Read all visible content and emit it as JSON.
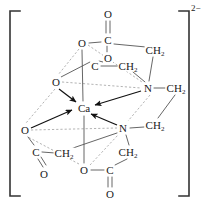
{
  "figure": {
    "charge": "2−",
    "ion_center": "Ca",
    "colors": {
      "bond": "#4d4d4d",
      "dashed": "#8c8c8c",
      "arrow": "#111111",
      "bracket": "#333333",
      "text": "#1a1a1a",
      "background": "#ffffff"
    }
  },
  "brackets": {
    "left": "[",
    "right": "]"
  },
  "atoms": [
    {
      "id": "o-top-double",
      "label": "O",
      "sub": "",
      "x": 108,
      "y": 14
    },
    {
      "id": "c-top",
      "label": "C",
      "sub": "",
      "x": 108,
      "y": 40
    },
    {
      "id": "o-top-left",
      "label": "O",
      "sub": "",
      "x": 82,
      "y": 43
    },
    {
      "id": "ch2-top-right",
      "label": "CH",
      "sub": "2",
      "x": 155,
      "y": 50
    },
    {
      "id": "o-upper-mid",
      "label": "O",
      "sub": "",
      "x": 108,
      "y": 58
    },
    {
      "id": "c-upper-left",
      "label": "C",
      "sub": "",
      "x": 95,
      "y": 66
    },
    {
      "id": "ch2-upper-mid",
      "label": "CH",
      "sub": "2",
      "x": 128,
      "y": 66
    },
    {
      "id": "o-upper-left",
      "label": "O",
      "sub": "",
      "x": 56,
      "y": 82
    },
    {
      "id": "n-upper",
      "label": "N",
      "sub": "",
      "x": 148,
      "y": 88
    },
    {
      "id": "ch2-right-top",
      "label": "CH",
      "sub": "2",
      "x": 176,
      "y": 88
    },
    {
      "id": "ca-center",
      "label": "Ca",
      "sub": "",
      "x": 84,
      "y": 108
    },
    {
      "id": "o-lower-left",
      "label": "O",
      "sub": "",
      "x": 25,
      "y": 130
    },
    {
      "id": "n-lower",
      "label": "N",
      "sub": "",
      "x": 123,
      "y": 128
    },
    {
      "id": "ch2-right-bot",
      "label": "CH",
      "sub": "2",
      "x": 155,
      "y": 125
    },
    {
      "id": "c-lower-left",
      "label": "C",
      "sub": "",
      "x": 36,
      "y": 152
    },
    {
      "id": "ch2-lower-left",
      "label": "CH",
      "sub": "2",
      "x": 64,
      "y": 153
    },
    {
      "id": "ch2-bottom-mid",
      "label": "CH",
      "sub": "2",
      "x": 128,
      "y": 152
    },
    {
      "id": "o-bottom-left",
      "label": "O",
      "sub": "",
      "x": 44,
      "y": 174
    },
    {
      "id": "o-bottom-mid",
      "label": "O",
      "sub": "",
      "x": 84,
      "y": 170
    },
    {
      "id": "c-bottom",
      "label": "C",
      "sub": "",
      "x": 110,
      "y": 170
    },
    {
      "id": "o-bottom",
      "label": "O",
      "sub": "",
      "x": 110,
      "y": 194
    }
  ],
  "bonds": [
    {
      "from": "o-top-double",
      "to": "c-top",
      "type": "double-vertical"
    },
    {
      "from": "c-top",
      "to": "o-top-left",
      "type": "single"
    },
    {
      "from": "c-top",
      "to": "ch2-top-right",
      "type": "single"
    },
    {
      "from": "c-top",
      "to": "o-upper-mid",
      "type": "single"
    },
    {
      "from": "o-upper-mid",
      "to": "c-upper-left",
      "type": "single"
    },
    {
      "from": "c-upper-left",
      "to": "ch2-upper-mid",
      "type": "single"
    },
    {
      "from": "ch2-upper-mid",
      "to": "n-upper",
      "type": "single"
    },
    {
      "from": "ch2-top-right",
      "to": "n-upper",
      "type": "single"
    },
    {
      "from": "n-upper",
      "to": "ch2-right-top",
      "type": "single"
    },
    {
      "from": "ch2-right-top",
      "to": "ch2-right-bot",
      "type": "single"
    },
    {
      "from": "ch2-right-bot",
      "to": "n-lower",
      "type": "single"
    },
    {
      "from": "n-lower",
      "to": "ch2-bottom-mid",
      "type": "single"
    },
    {
      "from": "ch2-bottom-mid",
      "to": "c-bottom",
      "type": "single"
    },
    {
      "from": "c-bottom",
      "to": "o-bottom",
      "type": "double-vertical"
    },
    {
      "from": "c-bottom",
      "to": "o-bottom-mid",
      "type": "single"
    },
    {
      "from": "o-bottom-mid",
      "to": "ca-center",
      "type": "single"
    },
    {
      "from": "o-top-left",
      "to": "ca-center",
      "type": "single"
    },
    {
      "from": "o-upper-left",
      "to": "c-upper-left",
      "type": "single"
    },
    {
      "from": "o-lower-left",
      "to": "c-lower-left",
      "type": "single"
    },
    {
      "from": "c-lower-left",
      "to": "ch2-lower-left",
      "type": "single"
    },
    {
      "from": "c-lower-left",
      "to": "o-bottom-left",
      "type": "double-slant"
    },
    {
      "from": "ch2-lower-left",
      "to": "n-lower",
      "type": "single"
    }
  ],
  "coordination_arrows": [
    {
      "from": "o-upper-left",
      "to": "ca-center"
    },
    {
      "from": "o-lower-left",
      "to": "ca-center"
    },
    {
      "from": "n-upper",
      "to": "ca-center"
    },
    {
      "from": "n-lower",
      "to": "ca-center"
    }
  ],
  "dashed_octahedron_edges": [
    {
      "from": "o-upper-left",
      "to": "n-upper"
    },
    {
      "from": "o-lower-left",
      "to": "n-lower"
    },
    {
      "from": "o-upper-left",
      "to": "o-lower-left"
    },
    {
      "from": "n-upper",
      "to": "n-lower"
    },
    {
      "from": "o-top-left",
      "to": "o-upper-left"
    },
    {
      "from": "o-top-left",
      "to": "n-upper"
    },
    {
      "from": "o-bottom-mid",
      "to": "o-lower-left"
    },
    {
      "from": "o-bottom-mid",
      "to": "n-lower"
    }
  ]
}
